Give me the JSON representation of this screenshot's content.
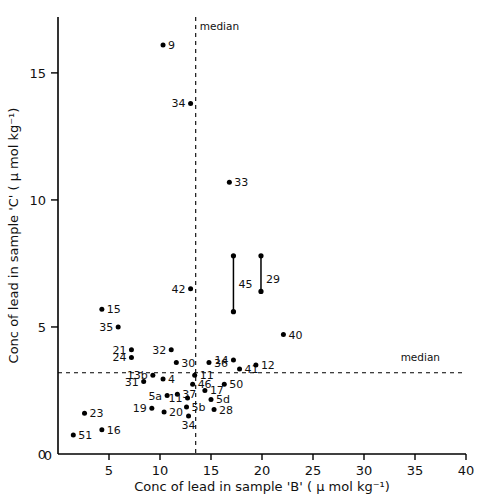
{
  "chart_data": {
    "type": "scatter",
    "title": "",
    "xlabel": "Conc of lead in sample 'B' ( μ mol kg⁻¹)",
    "ylabel": "Conc of lead in sample 'C' ( μ mol kg⁻¹)",
    "xlim": [
      0,
      40
    ],
    "ylim": [
      0,
      17.2
    ],
    "xticks": [
      0,
      5,
      10,
      15,
      20,
      25,
      30,
      35,
      40
    ],
    "xticklabels": [
      "0",
      "5",
      "10",
      "15",
      "20",
      "25",
      "30",
      "35",
      "40"
    ],
    "yticks": [
      0,
      5,
      10,
      15
    ],
    "yticklabels": [
      "0",
      "5",
      "10",
      "15"
    ],
    "grid": false,
    "legend": null,
    "annotations": [
      {
        "name": "median-vertical-label",
        "text": "median",
        "x": 13.5,
        "y": 16.7
      },
      {
        "name": "median-horizontal-label",
        "text": "median",
        "x": 33.2,
        "y": 3.65
      }
    ],
    "reference_lines": [
      {
        "name": "median-vertical",
        "orientation": "vertical",
        "value": 13.5,
        "style": "dashed",
        "label": "median"
      },
      {
        "name": "median-horizontal",
        "orientation": "horizontal",
        "value": 3.2,
        "style": "dashed",
        "label": "median"
      }
    ],
    "points": [
      {
        "label": "9",
        "x": 10.3,
        "y": 16.1,
        "lpos": "right"
      },
      {
        "label": "34",
        "x": 13.0,
        "y": 13.8,
        "lpos": "left"
      },
      {
        "label": "33",
        "x": 16.8,
        "y": 10.7,
        "lpos": "right"
      },
      {
        "label": "45",
        "x": 17.2,
        "y": 6.7,
        "lpos": "right",
        "ylow": 5.6,
        "yhigh": 7.8
      },
      {
        "label": "29",
        "x": 19.9,
        "y": 6.9,
        "lpos": "right",
        "ylow": 6.4,
        "yhigh": 7.8
      },
      {
        "label": "42",
        "x": 13.0,
        "y": 6.5,
        "lpos": "left"
      },
      {
        "label": "15",
        "x": 4.3,
        "y": 5.7,
        "lpos": "right"
      },
      {
        "label": "35",
        "x": 5.9,
        "y": 5.0,
        "lpos": "left"
      },
      {
        "label": "40",
        "x": 22.1,
        "y": 4.7,
        "lpos": "right"
      },
      {
        "label": "21",
        "x": 7.2,
        "y": 4.1,
        "lpos": "left"
      },
      {
        "label": "24",
        "x": 7.2,
        "y": 3.8,
        "lpos": "left"
      },
      {
        "label": "32",
        "x": 11.1,
        "y": 4.1,
        "lpos": "left"
      },
      {
        "label": "30",
        "x": 11.6,
        "y": 3.6,
        "lpos": "right"
      },
      {
        "label": "36",
        "x": 14.8,
        "y": 3.6,
        "lpos": "right"
      },
      {
        "label": "14",
        "x": 17.2,
        "y": 3.7,
        "lpos": "left"
      },
      {
        "label": "41",
        "x": 17.8,
        "y": 3.35,
        "lpos": "right"
      },
      {
        "label": "12",
        "x": 19.4,
        "y": 3.5,
        "lpos": "right"
      },
      {
        "label": "13b",
        "x": 9.3,
        "y": 3.1,
        "lpos": "left"
      },
      {
        "label": "11",
        "x": 13.4,
        "y": 3.1,
        "lpos": "right"
      },
      {
        "label": "31",
        "x": 8.4,
        "y": 2.85,
        "lpos": "left"
      },
      {
        "label": "4",
        "x": 10.3,
        "y": 2.95,
        "lpos": "right"
      },
      {
        "label": "46",
        "x": 13.2,
        "y": 2.75,
        "lpos": "right"
      },
      {
        "label": "50",
        "x": 16.3,
        "y": 2.75,
        "lpos": "right"
      },
      {
        "label": "17",
        "x": 14.4,
        "y": 2.5,
        "lpos": "right"
      },
      {
        "label": "5a",
        "x": 10.7,
        "y": 2.3,
        "lpos": "left"
      },
      {
        "label": "37",
        "x": 11.7,
        "y": 2.35,
        "lpos": "right"
      },
      {
        "label": "11b",
        "x": 12.7,
        "y": 2.2,
        "lpos": "left"
      },
      {
        "label": "5d",
        "x": 15.0,
        "y": 2.15,
        "lpos": "right"
      },
      {
        "label": "19",
        "x": 9.2,
        "y": 1.8,
        "lpos": "left"
      },
      {
        "label": "20",
        "x": 10.4,
        "y": 1.65,
        "lpos": "right"
      },
      {
        "label": "5b",
        "x": 12.6,
        "y": 1.85,
        "lpos": "right"
      },
      {
        "label": "28",
        "x": 15.3,
        "y": 1.75,
        "lpos": "right"
      },
      {
        "label": "34b",
        "x": 12.8,
        "y": 1.5,
        "lpos": "below"
      },
      {
        "label": "23",
        "x": 2.6,
        "y": 1.6,
        "lpos": "right"
      },
      {
        "label": "16",
        "x": 4.3,
        "y": 0.95,
        "lpos": "right"
      },
      {
        "label": "51",
        "x": 1.5,
        "y": 0.75,
        "lpos": "right"
      }
    ]
  }
}
